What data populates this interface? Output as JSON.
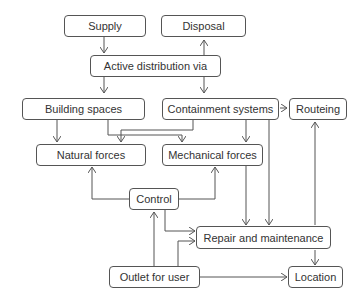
{
  "diagram": {
    "nodes": {
      "supply": "Supply",
      "disposal": "Disposal",
      "active": "Active distribution via",
      "building": "Building spaces",
      "containment": "Containment systems",
      "routeing": "Routeing",
      "natural": "Natural forces",
      "mechanical": "Mechanical forces",
      "control": "Control",
      "repair": "Repair and maintenance",
      "outlet": "Outlet for user",
      "location": "Location"
    },
    "edges": [
      {
        "from": "Supply",
        "to": "Active distribution via"
      },
      {
        "from": "Active distribution via",
        "to": "Disposal"
      },
      {
        "from": "Active distribution via",
        "to": "Building spaces"
      },
      {
        "from": "Active distribution via",
        "to": "Containment systems"
      },
      {
        "from": "Containment systems",
        "to": "Routeing"
      },
      {
        "from": "Building spaces",
        "to": "Natural forces"
      },
      {
        "from": "Building spaces",
        "to": "Mechanical forces"
      },
      {
        "from": "Containment systems",
        "to": "Natural forces"
      },
      {
        "from": "Containment systems",
        "to": "Mechanical forces"
      },
      {
        "from": "Containment systems",
        "to": "Repair and maintenance"
      },
      {
        "from": "Control",
        "to": "Natural forces"
      },
      {
        "from": "Control",
        "to": "Mechanical forces"
      },
      {
        "from": "Control",
        "to": "Repair and maintenance"
      },
      {
        "from": "Mechanical forces",
        "to": "Repair and maintenance"
      },
      {
        "from": "Location",
        "to": "Routeing"
      },
      {
        "from": "Repair and maintenance",
        "to": "Location"
      },
      {
        "from": "Outlet for user",
        "to": "Control"
      },
      {
        "from": "Outlet for user",
        "to": "Repair and maintenance"
      },
      {
        "from": "Outlet for user",
        "to": "Location"
      }
    ]
  }
}
